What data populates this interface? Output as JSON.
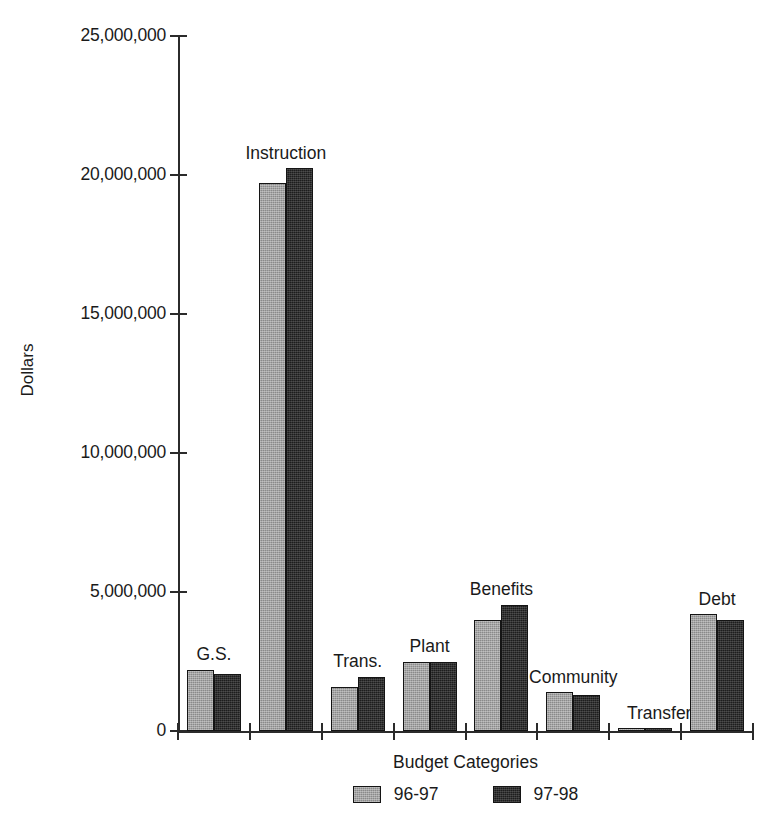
{
  "chart_data": {
    "type": "bar",
    "title": "",
    "xlabel": "Budget Categories",
    "ylabel": "Dollars",
    "categories": [
      "G.S.",
      "Instruction",
      "Trans.",
      "Plant",
      "Benefits",
      "Community",
      "Transfer",
      "Debt"
    ],
    "series": [
      {
        "name": "96-97",
        "color": "#8a8a8a",
        "values": [
          2200000,
          19700000,
          1600000,
          2500000,
          4000000,
          1400000,
          100000,
          4200000
        ]
      },
      {
        "name": "97-98",
        "color": "#1d1d1d",
        "values": [
          2050000,
          20250000,
          1950000,
          2500000,
          4550000,
          1300000,
          100000,
          4000000
        ]
      }
    ],
    "ylim": [
      0,
      25000000
    ],
    "ytick_values": [
      0,
      5000000,
      10000000,
      15000000,
      20000000,
      25000000
    ],
    "ytick_labels": [
      "0",
      "5,000,000",
      "10,000,000",
      "15,000,000",
      "20,000,000",
      "25,000,000"
    ],
    "grid": false,
    "legend_position": "bottom-center"
  },
  "axes": {
    "y_title": "Dollars",
    "x_title": "Budget Categories"
  },
  "legend": {
    "items": [
      {
        "label": "96-97",
        "swatch": "gray-swatch"
      },
      {
        "label": "97-98",
        "swatch": "black-swatch"
      }
    ]
  }
}
